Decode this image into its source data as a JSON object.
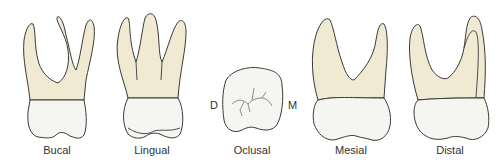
{
  "figure": {
    "views": [
      {
        "id": "bucal",
        "label": "Bucal"
      },
      {
        "id": "lingual",
        "label": "Lingual"
      },
      {
        "id": "oclusal",
        "label": "Oclusal"
      },
      {
        "id": "mesial",
        "label": "Mesial"
      },
      {
        "id": "distal",
        "label": "Distal"
      }
    ],
    "orientation": {
      "left": "D",
      "right": "M"
    },
    "colors": {
      "root": "#f0ead2",
      "crown": "#f5f5f1",
      "outline": "#3a3a3a"
    }
  }
}
